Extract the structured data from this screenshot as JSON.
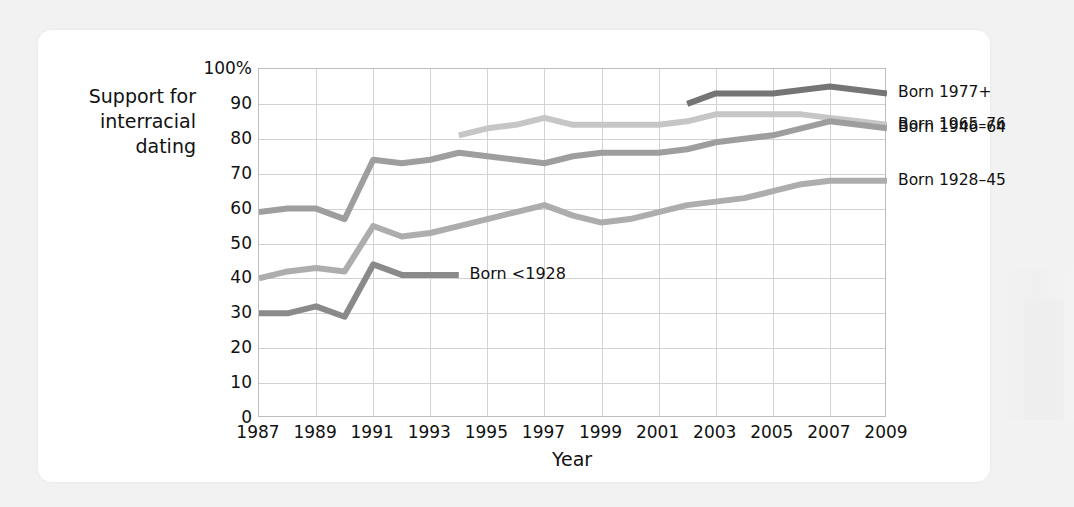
{
  "chart_data": {
    "type": "line",
    "title": "",
    "xlabel": "Year",
    "ylabel": "Support for interracial dating",
    "ylabel_lines": [
      "Support for",
      "interracial",
      "dating"
    ],
    "xlim": [
      1987,
      2009
    ],
    "ylim": [
      0,
      100
    ],
    "grid": true,
    "legend_position": "right",
    "x_ticks": [
      "1987",
      "1989",
      "1991",
      "1993",
      "1995",
      "1997",
      "1999",
      "2001",
      "2003",
      "2005",
      "2007",
      "2009"
    ],
    "x_tick_values": [
      1987,
      1989,
      1991,
      1993,
      1995,
      1997,
      1999,
      2001,
      2003,
      2005,
      2007,
      2009
    ],
    "y_ticks": [
      "0",
      "10",
      "20",
      "30",
      "40",
      "50",
      "60",
      "70",
      "80",
      "90",
      "100%"
    ],
    "y_tick_values": [
      0,
      10,
      20,
      30,
      40,
      50,
      60,
      70,
      80,
      90,
      100
    ],
    "series": [
      {
        "name": "Born 1977+",
        "label": "Born 1977+",
        "color": "#757575",
        "label_position": "legend",
        "x": [
          2002,
          2003,
          2004,
          2005,
          2006,
          2007,
          2008,
          2009
        ],
        "values": [
          90,
          93,
          93,
          93,
          94,
          95,
          94,
          93
        ]
      },
      {
        "name": "Born 1965-76",
        "label": "Born 1965–76",
        "color": "#c6c6c6",
        "label_position": "legend",
        "x": [
          1994,
          1995,
          1996,
          1997,
          1998,
          1999,
          2000,
          2001,
          2002,
          2003,
          2004,
          2005,
          2006,
          2007,
          2008,
          2009
        ],
        "values": [
          81,
          83,
          84,
          86,
          84,
          84,
          84,
          84,
          85,
          87,
          87,
          87,
          87,
          86,
          85,
          84
        ]
      },
      {
        "name": "Born 1946-64",
        "label": "Born 1946–64",
        "color": "#9e9e9e",
        "label_position": "legend",
        "x": [
          1987,
          1988,
          1989,
          1990,
          1991,
          1992,
          1993,
          1994,
          1995,
          1996,
          1997,
          1998,
          1999,
          2000,
          2001,
          2002,
          2003,
          2004,
          2005,
          2006,
          2007,
          2008,
          2009
        ],
        "values": [
          59,
          60,
          60,
          57,
          74,
          73,
          74,
          76,
          75,
          74,
          73,
          75,
          76,
          76,
          76,
          77,
          79,
          80,
          81,
          83,
          85,
          84,
          83
        ]
      },
      {
        "name": "Born 1928-45",
        "label": "Born 1928–45",
        "color": "#adadad",
        "label_position": "legend",
        "x": [
          1987,
          1988,
          1989,
          1990,
          1991,
          1992,
          1993,
          1994,
          1995,
          1996,
          1997,
          1998,
          1999,
          2000,
          2001,
          2002,
          2003,
          2004,
          2005,
          2006,
          2007,
          2008,
          2009
        ],
        "values": [
          40,
          42,
          43,
          42,
          55,
          52,
          53,
          55,
          57,
          59,
          61,
          58,
          56,
          57,
          59,
          61,
          62,
          63,
          65,
          67,
          68,
          68,
          68
        ]
      },
      {
        "name": "Born <1928",
        "label": "Born <1928",
        "color": "#8a8a8a",
        "label_position": "inline",
        "x": [
          1987,
          1988,
          1989,
          1990,
          1991,
          1992,
          1993,
          1994
        ],
        "values": [
          30,
          30,
          32,
          29,
          44,
          41,
          41,
          41
        ]
      }
    ],
    "inline_annotations": [
      {
        "text": "Born <1928",
        "x": 1994.2,
        "y": 41
      }
    ]
  }
}
